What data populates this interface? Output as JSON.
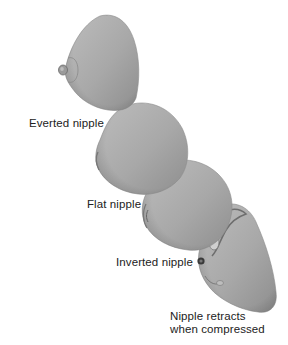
{
  "figure": {
    "type": "anatomical illustration",
    "background_color": "#ffffff",
    "shape_fill_color": "#a9a9a9",
    "shape_shadow_color": "#7d7d7d",
    "label_color": "#222222",
    "panels": [
      {
        "id": "everted",
        "label": "Everted nipple"
      },
      {
        "id": "flat",
        "label": "Flat nipple"
      },
      {
        "id": "inverted",
        "label": "Inverted nipple"
      },
      {
        "id": "retracts",
        "label_line1": "Nipple retracts",
        "label_line2": "when compressed"
      }
    ],
    "caption": ""
  }
}
